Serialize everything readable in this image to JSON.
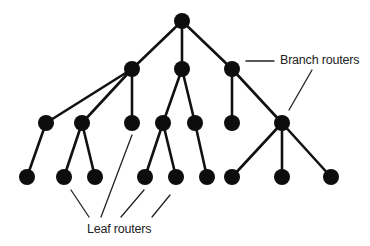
{
  "diagram": {
    "type": "tree",
    "title": "",
    "node_radius": 8,
    "colors": {
      "node": "#0d0d0d",
      "edge": "#111111",
      "callout": "#222222",
      "text": "#222222",
      "background": "#ffffff"
    },
    "nodes": [
      {
        "id": "root",
        "x": 182,
        "y": 21,
        "level": 0,
        "role": "branch"
      },
      {
        "id": "b1",
        "x": 132,
        "y": 69,
        "level": 1,
        "role": "branch"
      },
      {
        "id": "b2",
        "x": 182,
        "y": 69,
        "level": 1,
        "role": "branch"
      },
      {
        "id": "b3",
        "x": 232,
        "y": 69,
        "level": 1,
        "role": "branch"
      },
      {
        "id": "c1",
        "x": 46,
        "y": 123,
        "level": 2,
        "role": "branch"
      },
      {
        "id": "c2",
        "x": 82,
        "y": 123,
        "level": 2,
        "role": "branch"
      },
      {
        "id": "c3",
        "x": 132,
        "y": 123,
        "level": 2,
        "role": "leaf"
      },
      {
        "id": "c4",
        "x": 163,
        "y": 123,
        "level": 2,
        "role": "branch"
      },
      {
        "id": "c5",
        "x": 195,
        "y": 123,
        "level": 2,
        "role": "branch"
      },
      {
        "id": "c6",
        "x": 232,
        "y": 123,
        "level": 2,
        "role": "leaf"
      },
      {
        "id": "c7",
        "x": 282,
        "y": 123,
        "level": 2,
        "role": "branch"
      },
      {
        "id": "l1",
        "x": 27,
        "y": 177,
        "level": 3,
        "role": "leaf"
      },
      {
        "id": "l2",
        "x": 64,
        "y": 177,
        "level": 3,
        "role": "leaf"
      },
      {
        "id": "l3",
        "x": 95,
        "y": 177,
        "level": 3,
        "role": "leaf"
      },
      {
        "id": "l4",
        "x": 145,
        "y": 177,
        "level": 3,
        "role": "leaf"
      },
      {
        "id": "l5",
        "x": 176,
        "y": 177,
        "level": 3,
        "role": "leaf"
      },
      {
        "id": "l6",
        "x": 207,
        "y": 177,
        "level": 3,
        "role": "leaf"
      },
      {
        "id": "l7",
        "x": 232,
        "y": 177,
        "level": 3,
        "role": "leaf"
      },
      {
        "id": "l8",
        "x": 282,
        "y": 177,
        "level": 3,
        "role": "leaf"
      },
      {
        "id": "l9",
        "x": 331,
        "y": 177,
        "level": 3,
        "role": "leaf"
      }
    ],
    "edges": [
      [
        "root",
        "b1"
      ],
      [
        "root",
        "b2"
      ],
      [
        "root",
        "b3"
      ],
      [
        "b1",
        "c1"
      ],
      [
        "b1",
        "c2"
      ],
      [
        "b1",
        "c3"
      ],
      [
        "b2",
        "c4"
      ],
      [
        "b2",
        "c5"
      ],
      [
        "b3",
        "c6"
      ],
      [
        "b3",
        "c7"
      ],
      [
        "c1",
        "l1"
      ],
      [
        "c2",
        "l2"
      ],
      [
        "c2",
        "l3"
      ],
      [
        "c4",
        "l4"
      ],
      [
        "c4",
        "l5"
      ],
      [
        "c5",
        "l6"
      ],
      [
        "c7",
        "l7"
      ],
      [
        "c7",
        "l8"
      ],
      [
        "c7",
        "l9"
      ]
    ],
    "labels": {
      "branch": {
        "text": "Branch routers",
        "x": 280,
        "y": 64,
        "pointers": [
          {
            "x1": 246,
            "y1": 61,
            "x2": 274,
            "y2": 61
          },
          {
            "x1": 312,
            "y1": 70,
            "x2": 289,
            "y2": 110
          }
        ]
      },
      "leaf": {
        "text": "Leaf routers",
        "x": 87,
        "y": 233,
        "pointers": [
          {
            "x1": 71,
            "y1": 190,
            "x2": 89,
            "y2": 217
          },
          {
            "x1": 132,
            "y1": 135,
            "x2": 101,
            "y2": 217
          },
          {
            "x1": 144,
            "y1": 190,
            "x2": 121,
            "y2": 217
          },
          {
            "x1": 170,
            "y1": 195,
            "x2": 152,
            "y2": 217
          }
        ]
      }
    }
  }
}
